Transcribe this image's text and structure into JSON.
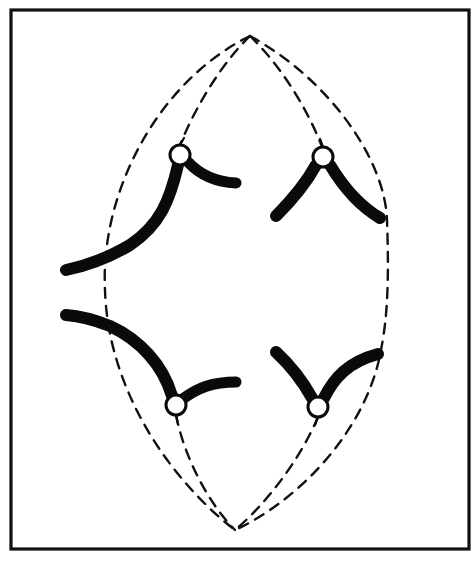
{
  "figure": {
    "title": "Spindle with four chromosomes attached at centromeres",
    "frame": {
      "x": 11,
      "y": 10,
      "width": 458,
      "height": 539
    },
    "colors": {
      "ink": "#0a0a0a",
      "background": "#ffffff",
      "centromere_fill": "#ffffff"
    },
    "poles": [
      {
        "name": "top-pole",
        "x": 250,
        "y": 36
      },
      {
        "name": "bottom-pole",
        "x": 235,
        "y": 530
      }
    ],
    "spindle_fibers": [
      {
        "name": "outer-left-fiber",
        "style": "dashed"
      },
      {
        "name": "inner-left-fiber",
        "style": "dashed"
      },
      {
        "name": "inner-right-fiber",
        "style": "dashed"
      },
      {
        "name": "outer-right-fiber",
        "style": "dashed"
      }
    ],
    "chromosomes": [
      {
        "name": "chromosome-upper-left",
        "centromere": {
          "x": 180,
          "y": 155
        },
        "shape": "long arm curving down-left, short arm right"
      },
      {
        "name": "chromosome-upper-right",
        "centromere": {
          "x": 323,
          "y": 157
        },
        "shape": "inverted V"
      },
      {
        "name": "chromosome-lower-left",
        "centromere": {
          "x": 176,
          "y": 405
        },
        "shape": "long arm curving up-left, short arm right"
      },
      {
        "name": "chromosome-lower-right",
        "centromere": {
          "x": 318,
          "y": 407
        },
        "shape": "V"
      }
    ]
  }
}
